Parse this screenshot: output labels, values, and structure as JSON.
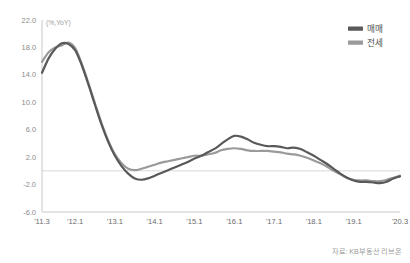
{
  "chart_data": {
    "type": "line",
    "title": "",
    "unit_label": "(%,YoY)",
    "xlabel": "",
    "ylabel": "",
    "ylim": [
      -6.0,
      22.0
    ],
    "ytick_values": [
      22.0,
      18.0,
      14.0,
      10.0,
      6.0,
      2.0,
      -2.0,
      -6.0
    ],
    "ytick_labels": [
      "22.0",
      "18.0",
      "14.0",
      "10.0",
      "6.0",
      "2.0",
      "-2.0",
      "-6.0"
    ],
    "xtick_labels": [
      "'11.3",
      "'12.1",
      "'13.1",
      "'14.1",
      "'15.1",
      "'16.1",
      "'17.1",
      "'18.1",
      "'19.1",
      "'20.3"
    ],
    "xtick_positions": [
      0,
      10,
      22,
      34,
      46,
      58,
      70,
      82,
      94,
      108
    ],
    "x_index_min": 0,
    "x_index_max": 108,
    "grid": "zero-line-only",
    "legend_position": "top-right",
    "series": [
      {
        "name": "매매",
        "color": "#595959",
        "x": [
          0,
          2,
          4,
          6,
          8,
          10,
          12,
          14,
          16,
          18,
          20,
          22,
          24,
          26,
          28,
          30,
          32,
          34,
          36,
          38,
          40,
          42,
          44,
          46,
          48,
          50,
          52,
          54,
          56,
          58,
          60,
          62,
          64,
          66,
          68,
          70,
          72,
          74,
          76,
          78,
          80,
          82,
          84,
          86,
          88,
          90,
          92,
          94,
          96,
          98,
          100,
          102,
          104,
          106,
          108
        ],
        "values": [
          14.3,
          16.4,
          17.8,
          18.6,
          18.5,
          17.6,
          15.4,
          12.6,
          9.6,
          6.7,
          4.2,
          2.2,
          0.7,
          -0.4,
          -1.1,
          -1.3,
          -1.1,
          -0.7,
          -0.3,
          0.1,
          0.5,
          0.9,
          1.3,
          1.8,
          2.2,
          2.7,
          3.2,
          3.9,
          4.6,
          5.1,
          5.0,
          4.6,
          4.1,
          3.8,
          3.6,
          3.6,
          3.5,
          3.3,
          3.4,
          3.2,
          2.7,
          2.2,
          1.6,
          1.0,
          0.3,
          -0.4,
          -1.0,
          -1.4,
          -1.6,
          -1.6,
          -1.7,
          -1.8,
          -1.6,
          -1.1,
          -0.8
        ]
      },
      {
        "name": "전세",
        "color": "#9a9a9a",
        "x": [
          0,
          2,
          4,
          6,
          8,
          10,
          12,
          14,
          16,
          18,
          20,
          22,
          24,
          26,
          28,
          30,
          32,
          34,
          36,
          38,
          40,
          42,
          44,
          46,
          48,
          50,
          52,
          54,
          56,
          58,
          60,
          62,
          64,
          66,
          68,
          70,
          72,
          74,
          76,
          78,
          80,
          82,
          84,
          86,
          88,
          90,
          92,
          94,
          96,
          98,
          100,
          102,
          104,
          106,
          108
        ],
        "values": [
          15.9,
          17.3,
          18.0,
          18.3,
          18.7,
          17.9,
          15.6,
          12.8,
          9.8,
          6.9,
          4.4,
          2.4,
          1.1,
          0.3,
          0.1,
          0.3,
          0.6,
          0.9,
          1.2,
          1.4,
          1.6,
          1.8,
          2.0,
          2.2,
          2.2,
          2.4,
          2.6,
          3.0,
          3.2,
          3.3,
          3.2,
          3.0,
          2.9,
          2.9,
          2.9,
          2.8,
          2.7,
          2.5,
          2.4,
          2.2,
          1.9,
          1.5,
          1.1,
          0.6,
          0.0,
          -0.5,
          -1.0,
          -1.3,
          -1.4,
          -1.4,
          -1.5,
          -1.5,
          -1.3,
          -1.0,
          -0.7
        ]
      }
    ]
  },
  "legend": {
    "items": [
      {
        "label": "매매",
        "color": "#595959"
      },
      {
        "label": "전세",
        "color": "#9a9a9a"
      }
    ]
  },
  "source": {
    "text": "자료: KB부동산 리브온"
  },
  "colors": {
    "axis": "#c8c8c8",
    "zero_line": "#d8d8d8",
    "tick_text": "#8a8a8a",
    "series_primary": "#595959",
    "series_secondary": "#9a9a9a"
  }
}
